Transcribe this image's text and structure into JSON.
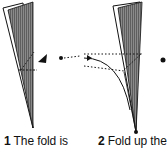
{
  "diagram": {
    "type": "origami-instructions",
    "steps": [
      {
        "number": "1",
        "text": "The fold is"
      },
      {
        "number": "2",
        "text": "Fold up the"
      }
    ],
    "colors": {
      "paper_shaded": "#7a7a7a",
      "outline": "#111111",
      "background": "#ffffff"
    }
  }
}
